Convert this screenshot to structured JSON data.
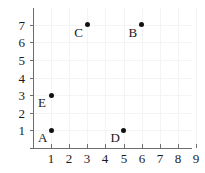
{
  "chart_data": {
    "type": "scatter",
    "title": "",
    "xlabel": "",
    "ylabel": "",
    "xlim": [
      0,
      9.5
    ],
    "ylim": [
      0,
      7.8
    ],
    "grid": true,
    "legend": "none",
    "x_ticks": [
      "1",
      "2",
      "3",
      "4",
      "5",
      "6",
      "7",
      "8",
      "9"
    ],
    "y_ticks": [
      "1",
      "2",
      "3",
      "4",
      "5",
      "6",
      "7"
    ],
    "points": [
      {
        "label": "A",
        "x": 1,
        "y": 1
      },
      {
        "label": "B",
        "x": 6,
        "y": 7
      },
      {
        "label": "C",
        "x": 3,
        "y": 7
      },
      {
        "label": "D",
        "x": 5,
        "y": 1
      },
      {
        "label": "E",
        "x": 1,
        "y": 3
      }
    ],
    "colors": {
      "point": "#111111",
      "axis": "#6e6e6e",
      "grid": "#f4f4f4",
      "text": "#1a1a1a",
      "background": "#ffffff"
    }
  }
}
